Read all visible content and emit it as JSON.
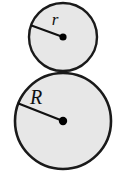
{
  "figure": {
    "type": "geometry-diagram",
    "background_color": "#ffffff",
    "fill_color": "#e7e7e7",
    "stroke_color": "#1a1a1a",
    "canvas": {
      "width": 121,
      "height": 181
    },
    "shapes": [
      {
        "name": "small-circle",
        "label": "r",
        "label_meaning": "radius of small circle",
        "cx": 63,
        "cy": 37,
        "r": 34,
        "stroke_width": 2.4,
        "label_x": 55,
        "label_y": 25,
        "label_font_size": 17,
        "center_dot_r": 3.6,
        "radius_line": {
          "x1": 63,
          "y1": 37,
          "x2": 31.5,
          "y2": 25.5
        }
      },
      {
        "name": "large-circle",
        "label": "R",
        "label_meaning": "radius of large circle",
        "cx": 63,
        "cy": 121,
        "r": 48,
        "stroke_width": 2.6,
        "label_x": 36,
        "label_y": 104,
        "label_font_size": 20,
        "center_dot_r": 4.2,
        "radius_line": {
          "x1": 63,
          "y1": 121,
          "x2": 18.5,
          "y2": 103.5
        }
      }
    ],
    "tangent_point": {
      "x": 63,
      "y": 71.5
    }
  }
}
